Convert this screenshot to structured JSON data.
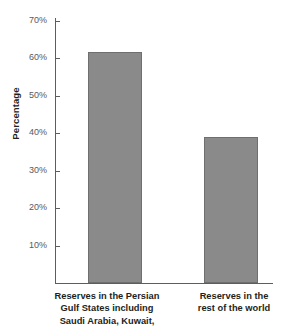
{
  "chart_data": {
    "type": "bar",
    "title": "",
    "xlabel": "",
    "ylabel": "Percentage",
    "ylim": [
      0,
      70
    ],
    "grid": false,
    "legend": null,
    "categories": [
      "Reserves in the Persian Gulf States including Saudi Arabia, Kuwait,",
      "Reserves in the rest of the world"
    ],
    "values": [
      61.5,
      39
    ],
    "value_unit": "%",
    "bar_color": "#8a8a8a",
    "bar_border_color": "#6f6f6f",
    "axis_color": "#5d5d5d",
    "tick_label_color": "#58595b",
    "yticks": [
      70,
      60,
      50,
      40,
      30,
      20,
      10
    ],
    "ytick_labels": [
      "70%",
      "60%",
      "50%",
      "40%",
      "30%",
      "20%",
      "10%"
    ]
  },
  "axis": {
    "y_title": "Percentage"
  },
  "categories_lines": [
    [
      "Reserves in the Persian",
      "Gulf States including",
      "Saudi Arabia, Kuwait,"
    ],
    [
      "Reserves in the",
      "rest of the world"
    ]
  ]
}
